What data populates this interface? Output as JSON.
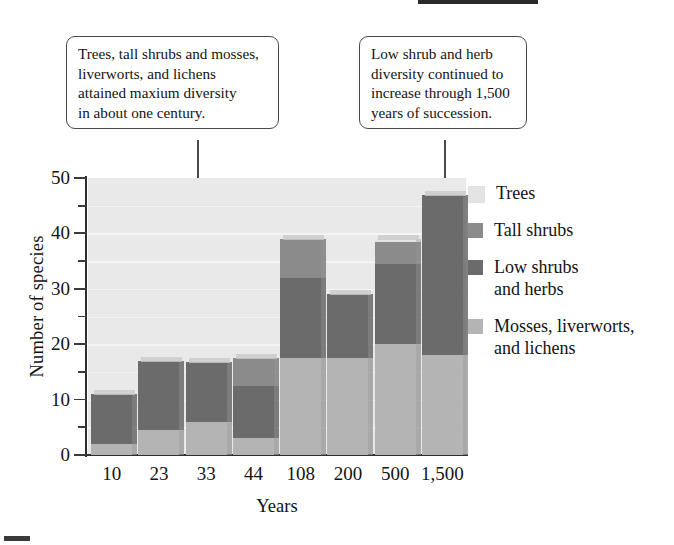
{
  "callouts": [
    {
      "id": "trees-callout",
      "lines": [
        "Trees, tall shrubs and mosses,",
        "liverworts, and lichens",
        "attained maxium diversity",
        "in about one century."
      ]
    },
    {
      "id": "low-shrub-callout",
      "lines": [
        "Low shrub and herb",
        "diversity continued to",
        "increase through 1,500",
        "years of succession."
      ]
    }
  ],
  "legend": {
    "position": "right",
    "entries": [
      {
        "label": "Trees",
        "color": "#e4e4e4"
      },
      {
        "label": "Tall shrubs",
        "color": "#8b8b8b"
      },
      {
        "label": "Low shrubs\nand herbs",
        "color": "#6b6b6b"
      },
      {
        "label": "Mosses, liverworts,\nand lichens",
        "color": "#b4b4b4"
      }
    ]
  },
  "chart_data": {
    "type": "bar",
    "stacked": true,
    "title": "",
    "xlabel": "Years",
    "ylabel": "Number of species",
    "categories": [
      "10",
      "23",
      "33",
      "44",
      "108",
      "200",
      "500",
      "1,500"
    ],
    "ylim": [
      0,
      50
    ],
    "yticks": [
      0,
      10,
      20,
      30,
      40,
      50
    ],
    "yticks_minor": [
      5,
      15,
      25,
      35,
      45
    ],
    "grid": true,
    "series": [
      {
        "name": "Mosses, liverworts, and lichens",
        "color": "#b4b4b4",
        "values": [
          2,
          4.5,
          6,
          3,
          17.5,
          17.5,
          20,
          18
        ]
      },
      {
        "name": "Low shrubs and herbs",
        "color": "#6b6b6b",
        "values": [
          9,
          12.5,
          10.8,
          9.5,
          14.5,
          11.5,
          14.5,
          29
        ]
      },
      {
        "name": "Tall shrubs",
        "color": "#8b8b8b",
        "values": [
          0,
          0,
          0,
          5,
          7,
          0,
          4,
          0
        ]
      },
      {
        "name": "Trees",
        "color": "#e4e4e4",
        "values": [
          0,
          0,
          0,
          0,
          0,
          0,
          0.5,
          0
        ]
      }
    ],
    "totals": [
      11,
      17,
      16.8,
      17.5,
      39,
      29,
      39,
      47
    ]
  }
}
